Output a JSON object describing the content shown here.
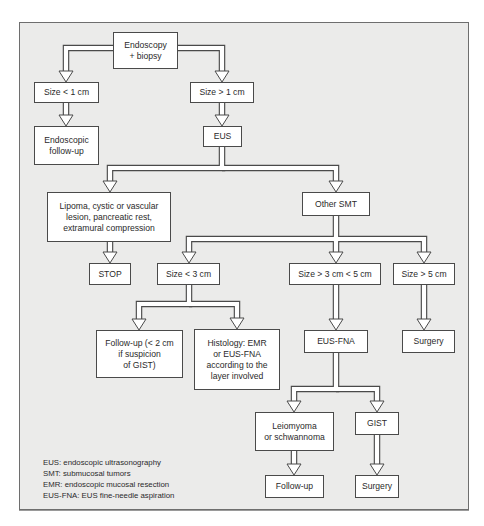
{
  "diagram": {
    "type": "flowchart",
    "frame": {
      "background": "#ebebea",
      "border": "#6e6e6e"
    },
    "nodes": [
      {
        "id": "endoscopy",
        "text": "Endoscopy\n+ biopsy",
        "x": 113,
        "y": 32,
        "w": 65,
        "h": 37
      },
      {
        "id": "size-lt-1",
        "text": "Size < 1 cm",
        "x": 34,
        "y": 82,
        "w": 65,
        "h": 21
      },
      {
        "id": "size-gt-1",
        "text": "Size > 1 cm",
        "x": 190,
        "y": 82,
        "w": 64,
        "h": 21
      },
      {
        "id": "endoscopic-follow-up",
        "text": "Endoscopic\nfollow-up",
        "x": 34,
        "y": 126,
        "w": 65,
        "h": 39
      },
      {
        "id": "eus",
        "text": "EUS",
        "x": 203,
        "y": 126,
        "w": 39,
        "h": 21
      },
      {
        "id": "lipoma",
        "text": "Lipoma, cystic or vascular\nlesion, pancreatic rest,\nextramural compression",
        "x": 47,
        "y": 192,
        "w": 124,
        "h": 50
      },
      {
        "id": "other-smt",
        "text": "Other SMT",
        "x": 302,
        "y": 192,
        "w": 68,
        "h": 24
      },
      {
        "id": "stop",
        "text": "STOP",
        "x": 89,
        "y": 263,
        "w": 42,
        "h": 22
      },
      {
        "id": "size-lt-3",
        "text": "Size < 3 cm",
        "x": 157,
        "y": 263,
        "w": 63,
        "h": 22
      },
      {
        "id": "size-3-5",
        "text": "Size > 3 cm < 5 cm",
        "x": 289,
        "y": 263,
        "w": 92,
        "h": 22
      },
      {
        "id": "size-gt-5",
        "text": "Size > 5 cm",
        "x": 393,
        "y": 263,
        "w": 62,
        "h": 22
      },
      {
        "id": "follow-up-2cm",
        "text": "Follow-up (< 2 cm\nif suspicion\nof GIST)",
        "x": 96,
        "y": 330,
        "w": 87,
        "h": 48
      },
      {
        "id": "histology",
        "text": "Histology: EMR\nor EUS-FNA\naccording to the\nlayer involved",
        "x": 194,
        "y": 329,
        "w": 86,
        "h": 61
      },
      {
        "id": "eus-fna",
        "text": "EUS-FNA",
        "x": 304,
        "y": 330,
        "w": 64,
        "h": 23
      },
      {
        "id": "surgery-1",
        "text": "Surgery",
        "x": 402,
        "y": 330,
        "w": 53,
        "h": 23
      },
      {
        "id": "leiomyoma",
        "text": "Leiomyoma\nor schwannoma",
        "x": 255,
        "y": 412,
        "w": 79,
        "h": 39
      },
      {
        "id": "gist",
        "text": "GIST",
        "x": 355,
        "y": 412,
        "w": 44,
        "h": 23
      },
      {
        "id": "follow-up",
        "text": "Follow-up",
        "x": 265,
        "y": 475,
        "w": 59,
        "h": 23
      },
      {
        "id": "surgery-2",
        "text": "Surgery",
        "x": 355,
        "y": 475,
        "w": 44,
        "h": 23
      }
    ],
    "edges": [
      {
        "from": "endoscopy",
        "to": "size-lt-1"
      },
      {
        "from": "endoscopy",
        "to": "size-gt-1"
      },
      {
        "from": "size-lt-1",
        "to": "endoscopic-follow-up"
      },
      {
        "from": "size-gt-1",
        "to": "eus"
      },
      {
        "from": "eus",
        "to": "lipoma"
      },
      {
        "from": "eus",
        "to": "other-smt"
      },
      {
        "from": "lipoma",
        "to": "stop"
      },
      {
        "from": "other-smt",
        "to": "size-lt-3"
      },
      {
        "from": "other-smt",
        "to": "size-3-5"
      },
      {
        "from": "other-smt",
        "to": "size-gt-5"
      },
      {
        "from": "size-lt-3",
        "to": "follow-up-2cm"
      },
      {
        "from": "size-lt-3",
        "to": "histology"
      },
      {
        "from": "size-3-5",
        "to": "eus-fna"
      },
      {
        "from": "size-gt-5",
        "to": "surgery-1"
      },
      {
        "from": "eus-fna",
        "to": "leiomyoma"
      },
      {
        "from": "eus-fna",
        "to": "gist"
      },
      {
        "from": "leiomyoma",
        "to": "follow-up"
      },
      {
        "from": "gist",
        "to": "surgery-2"
      }
    ],
    "pipes": [
      {
        "d": "M113,48 L66,48 L66,72",
        "arrow": [
          66,
          82
        ]
      },
      {
        "d": "M178,48 L222,48 L222,72",
        "arrow": [
          222,
          82
        ]
      },
      {
        "d": "M66,103 L66,116",
        "arrow": [
          66,
          126
        ]
      },
      {
        "d": "M222,103 L222,116",
        "arrow": [
          222,
          126
        ]
      },
      {
        "d": "M222,147 L222,168 L110,168 L110,182",
        "arrow": [
          110,
          192
        ]
      },
      {
        "d": "M222,168 L336,168 L336,182",
        "arrow": [
          336,
          192
        ]
      },
      {
        "d": "M110,242 L110,253",
        "arrow": [
          110,
          263
        ]
      },
      {
        "d": "M336,216 L336,239 L189,239 L189,253",
        "arrow": [
          189,
          263
        ]
      },
      {
        "d": "M336,239 L336,253",
        "arrow": [
          336,
          263
        ]
      },
      {
        "d": "M336,239 L424,239 L424,253",
        "arrow": [
          424,
          263
        ]
      },
      {
        "d": "M189,285 L189,304 L139,304 L139,320",
        "arrow": [
          139,
          330
        ]
      },
      {
        "d": "M189,304 L237,304 L237,319",
        "arrow": [
          237,
          329
        ]
      },
      {
        "d": "M336,285 L336,320",
        "arrow": [
          336,
          330
        ]
      },
      {
        "d": "M424,285 L424,320",
        "arrow": [
          424,
          330
        ]
      },
      {
        "d": "M336,353 L336,389 L294,389 L294,402",
        "arrow": [
          294,
          412
        ]
      },
      {
        "d": "M336,389 L377,389 L377,402",
        "arrow": [
          377,
          412
        ]
      },
      {
        "d": "M294,451 L294,465",
        "arrow": [
          294,
          475
        ]
      },
      {
        "d": "M377,435 L377,465",
        "arrow": [
          377,
          475
        ]
      }
    ],
    "legend": [
      "EUS: endoscopic ultrasonography",
      "SMT: submucosal tumors",
      "EMR: endoscopic mucosal resection",
      "EUS-FNA: EUS fine-needle aspiration"
    ],
    "colors": {
      "line": "#4a4a4a",
      "fill": "#ffffff"
    }
  }
}
